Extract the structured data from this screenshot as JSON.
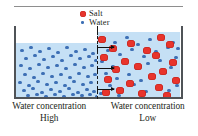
{
  "figure": {
    "title_rule": true,
    "legend": {
      "items": [
        {
          "icon": "salt-particle-icon",
          "label": "Salt",
          "color": "#e8342c"
        },
        {
          "icon": "water-particle-icon",
          "label": "Water",
          "color": "#3d6fb5"
        }
      ]
    },
    "container": {
      "wall_color": "#4f5357",
      "water_color": "#c5e0f5",
      "membrane": {
        "style": "dashed",
        "color": "#1a1a1a",
        "label": "semipermeable-membrane"
      },
      "flow_arrows": {
        "direction": "right",
        "count": 3
      },
      "left_compartment": {
        "water_level": "low",
        "salt_count": 0,
        "water_particle_count": 63
      },
      "right_compartment": {
        "water_level": "high",
        "salt_count": 22,
        "water_particle_count": 38
      }
    },
    "captions": [
      {
        "line1": "Water concentration",
        "line2": "High"
      },
      {
        "line1": "Water concentration",
        "line2": "Low"
      }
    ]
  },
  "chart_data": {
    "type": "diagram",
    "legend_entries": [
      "Salt",
      "Water"
    ],
    "annotations": [
      "Water concentration High",
      "Water concentration Low"
    ],
    "water_particles_left": [
      [
        4,
        6
      ],
      [
        13,
        3
      ],
      [
        22,
        7
      ],
      [
        31,
        4
      ],
      [
        40,
        8
      ],
      [
        49,
        3
      ],
      [
        58,
        7
      ],
      [
        67,
        5
      ],
      [
        75,
        9
      ],
      [
        8,
        14
      ],
      [
        17,
        11
      ],
      [
        26,
        15
      ],
      [
        35,
        12
      ],
      [
        44,
        16
      ],
      [
        53,
        11
      ],
      [
        62,
        14
      ],
      [
        71,
        12
      ],
      [
        78,
        16
      ],
      [
        3,
        21
      ],
      [
        12,
        24
      ],
      [
        21,
        20
      ],
      [
        30,
        23
      ],
      [
        39,
        21
      ],
      [
        48,
        24
      ],
      [
        57,
        20
      ],
      [
        66,
        23
      ],
      [
        74,
        21
      ],
      [
        7,
        30
      ],
      [
        16,
        33
      ],
      [
        25,
        29
      ],
      [
        34,
        32
      ],
      [
        43,
        30
      ],
      [
        52,
        33
      ],
      [
        61,
        29
      ],
      [
        70,
        32
      ],
      [
        77,
        30
      ],
      [
        2,
        38
      ],
      [
        11,
        41
      ],
      [
        20,
        37
      ],
      [
        29,
        40
      ],
      [
        38,
        38
      ],
      [
        47,
        41
      ],
      [
        56,
        37
      ],
      [
        65,
        40
      ],
      [
        73,
        38
      ],
      [
        6,
        46
      ],
      [
        15,
        44
      ],
      [
        24,
        48
      ],
      [
        33,
        45
      ],
      [
        42,
        47
      ],
      [
        51,
        44
      ],
      [
        60,
        48
      ],
      [
        69,
        45
      ],
      [
        76,
        47
      ],
      [
        10,
        51
      ],
      [
        19,
        50
      ],
      [
        28,
        52
      ],
      [
        37,
        50
      ],
      [
        46,
        52
      ],
      [
        55,
        50
      ],
      [
        64,
        51
      ],
      [
        72,
        50
      ],
      [
        79,
        52
      ]
    ],
    "water_particles_right": [
      [
        5,
        5
      ],
      [
        16,
        9
      ],
      [
        28,
        4
      ],
      [
        39,
        11
      ],
      [
        51,
        6
      ],
      [
        63,
        3
      ],
      [
        74,
        9
      ],
      [
        79,
        15
      ],
      [
        9,
        17
      ],
      [
        21,
        21
      ],
      [
        33,
        16
      ],
      [
        45,
        23
      ],
      [
        57,
        18
      ],
      [
        69,
        14
      ],
      [
        77,
        24
      ],
      [
        3,
        28
      ],
      [
        14,
        33
      ],
      [
        26,
        29
      ],
      [
        38,
        35
      ],
      [
        49,
        30
      ],
      [
        61,
        27
      ],
      [
        72,
        34
      ],
      [
        7,
        40
      ],
      [
        18,
        45
      ],
      [
        30,
        41
      ],
      [
        42,
        47
      ],
      [
        54,
        42
      ],
      [
        66,
        39
      ],
      [
        76,
        46
      ],
      [
        11,
        52
      ],
      [
        23,
        56
      ],
      [
        35,
        51
      ],
      [
        47,
        58
      ],
      [
        59,
        53
      ],
      [
        70,
        57
      ],
      [
        78,
        52
      ],
      [
        2,
        60
      ],
      [
        20,
        62
      ],
      [
        44,
        61
      ]
    ],
    "salt_particles_right": [
      [
        1,
        4
      ],
      [
        60,
        2
      ],
      [
        12,
        13
      ],
      [
        30,
        8
      ],
      [
        46,
        15
      ],
      [
        69,
        9
      ],
      [
        3,
        22
      ],
      [
        24,
        26
      ],
      [
        55,
        20
      ],
      [
        72,
        27
      ],
      [
        15,
        34
      ],
      [
        37,
        31
      ],
      [
        62,
        36
      ],
      [
        7,
        44
      ],
      [
        29,
        48
      ],
      [
        51,
        41
      ],
      [
        75,
        45
      ],
      [
        19,
        55
      ],
      [
        41,
        58
      ],
      [
        58,
        52
      ],
      [
        66,
        60
      ],
      [
        5,
        57
      ]
    ]
  }
}
